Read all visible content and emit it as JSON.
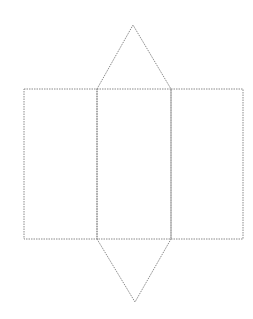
{
  "diagram": {
    "title": "",
    "line_color": "#8a8a8a",
    "line_style": "dotted",
    "faces": [
      {
        "name": "rectangle-left",
        "shape": "rectangle"
      },
      {
        "name": "rectangle-middle",
        "shape": "rectangle"
      },
      {
        "name": "rectangle-right",
        "shape": "rectangle"
      },
      {
        "name": "triangle-top",
        "shape": "triangle"
      },
      {
        "name": "triangle-bottom",
        "shape": "triangle"
      }
    ]
  }
}
